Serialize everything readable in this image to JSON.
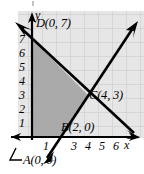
{
  "figure": {
    "type": "coordinate-plane-diagram",
    "width": 144,
    "height": 174,
    "background_color": "#ffffff",
    "grid": {
      "visible": true,
      "cell_color": "#e3e3e3",
      "line_color": "#c9c9c9",
      "cell_size_px": 14
    },
    "shaded_region": {
      "fill_color": "#a8a8a8",
      "vertices": [
        [
          0,
          0
        ],
        [
          2,
          0
        ],
        [
          4,
          3
        ],
        [
          0,
          7
        ]
      ]
    },
    "axes": {
      "color": "#000000",
      "x_label": "x",
      "y_label": "y",
      "x_ticks": [
        "1",
        "3",
        "4",
        "5",
        "6"
      ],
      "y_ticks": [
        "7",
        "6",
        "5",
        "4",
        "3",
        "2",
        "1"
      ],
      "x_range": [
        -0.5,
        7.2
      ],
      "y_range": [
        -0.6,
        7.8
      ]
    },
    "lines": [
      {
        "name": "descending-line",
        "through_points": [
          [
            0,
            7
          ],
          [
            4,
            3
          ]
        ],
        "arrowheads": "both",
        "color": "#000000"
      },
      {
        "name": "ascending-line",
        "through_points": [
          [
            2,
            0
          ],
          [
            4,
            3
          ]
        ],
        "arrowheads": "both",
        "color": "#000000"
      }
    ],
    "point_labels": [
      {
        "id": "D",
        "text": "D(0, 7)",
        "point": [
          0,
          7
        ]
      },
      {
        "id": "C",
        "text": "C(4, 3)",
        "point": [
          4,
          3
        ]
      },
      {
        "id": "B",
        "text": "B(2, 0)",
        "point": [
          2,
          0
        ]
      },
      {
        "id": "A",
        "text": "A(0, 0)",
        "point": [
          0,
          0
        ],
        "leader_line": true
      }
    ]
  }
}
